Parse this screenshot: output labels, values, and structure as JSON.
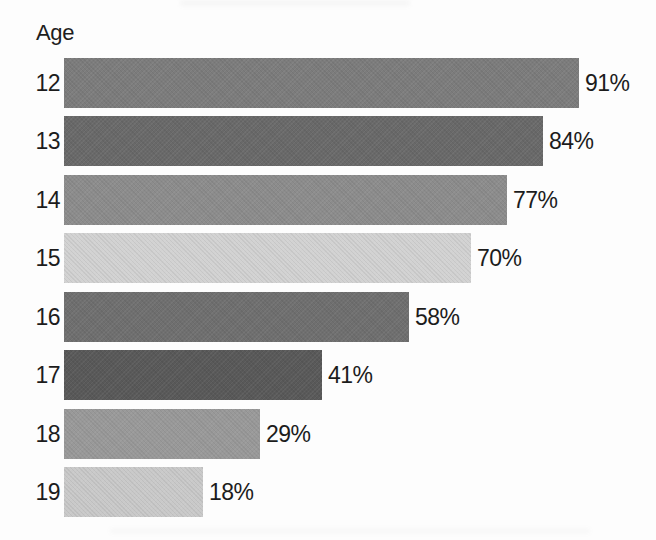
{
  "header": {
    "axis_title": "Age"
  },
  "chart_data": {
    "type": "bar",
    "orientation": "horizontal",
    "title": "",
    "xlabel": "",
    "ylabel": "Age",
    "grid": false,
    "legend": false,
    "value_range": [
      0,
      100
    ],
    "categories": [
      "12",
      "13",
      "14",
      "15",
      "16",
      "17",
      "18",
      "19"
    ],
    "values": [
      91,
      84,
      77,
      70,
      58,
      41,
      29,
      18
    ],
    "value_labels": [
      "91%",
      "84%",
      "77%",
      "70%",
      "58%",
      "41%",
      "29%",
      "18%"
    ],
    "bar_colors": [
      "#7c7c7c",
      "#696969",
      "#8c8c8c",
      "#d2d2d2",
      "#6f6f6f",
      "#595959",
      "#999999",
      "#c9c9c9"
    ],
    "text_color": "#1c1c1c",
    "background_color": "#fdfdfd"
  }
}
